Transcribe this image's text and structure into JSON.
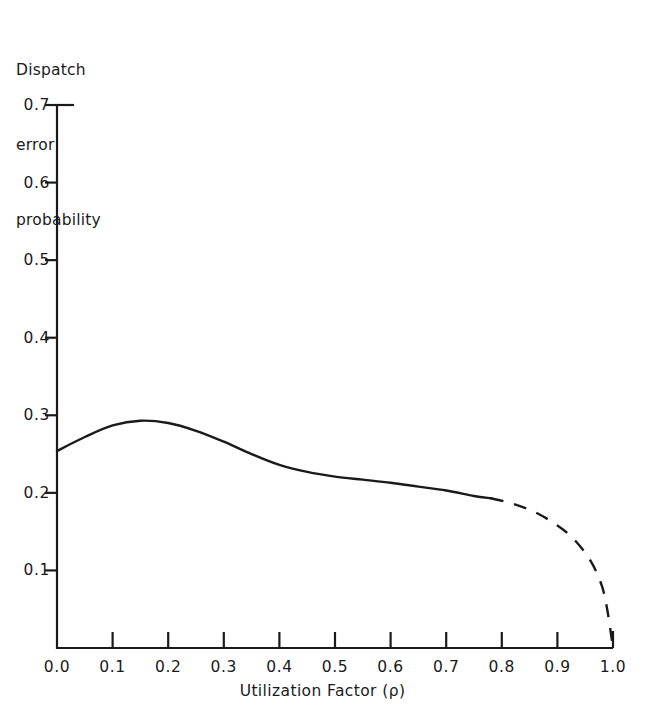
{
  "figure": {
    "background": "#ffffff",
    "ink_color": "#1a1a1a",
    "title_lines": [
      "Dispatch",
      "error",
      "probability"
    ]
  },
  "chart_data": {
    "type": "line",
    "title": "Dispatch error probability",
    "xlabel": "Utilization Factor (ρ)",
    "ylabel": "Dispatch error probability",
    "xlim": [
      0.0,
      1.0
    ],
    "ylim": [
      0.0,
      0.7
    ],
    "grid": false,
    "legend": null,
    "xticks": [
      "0.0",
      "0.1",
      "0.2",
      "0.3",
      "0.4",
      "0.5",
      "0.6",
      "0.7",
      "0.8",
      "0.9",
      "1.0"
    ],
    "xtick_values": [
      0.0,
      0.1,
      0.2,
      0.3,
      0.4,
      0.5,
      0.6,
      0.7,
      0.8,
      0.9,
      1.0
    ],
    "yticks": [
      "0.1",
      "0.2",
      "0.3",
      "0.4",
      "0.5",
      "0.6",
      "0.7"
    ],
    "ytick_values": [
      0.1,
      0.2,
      0.3,
      0.4,
      0.5,
      0.6,
      0.7
    ],
    "series": [
      {
        "name": "dispatch-error-probability-solid",
        "style": "solid",
        "x": [
          0.0,
          0.05,
          0.1,
          0.15,
          0.2,
          0.25,
          0.3,
          0.35,
          0.4,
          0.45,
          0.5,
          0.55,
          0.6,
          0.65,
          0.7,
          0.75,
          0.78
        ],
        "y": [
          0.254,
          0.272,
          0.287,
          0.293,
          0.29,
          0.28,
          0.266,
          0.25,
          0.236,
          0.227,
          0.221,
          0.217,
          0.213,
          0.208,
          0.203,
          0.196,
          0.193
        ]
      },
      {
        "name": "dispatch-error-probability-dashed",
        "style": "dashed",
        "x": [
          0.78,
          0.82,
          0.86,
          0.9,
          0.93,
          0.96,
          0.98,
          0.99,
          1.0
        ],
        "y": [
          0.193,
          0.186,
          0.175,
          0.158,
          0.14,
          0.112,
          0.08,
          0.048,
          0.0
        ]
      }
    ],
    "annotations": {
      "peak": {
        "x": 0.155,
        "y": 0.293
      },
      "start": {
        "x": 0.0,
        "y": 0.254
      },
      "solid_dash_transition": {
        "x": 0.78,
        "y": 0.193
      },
      "end": {
        "x": 1.0,
        "y": 0.0
      }
    }
  }
}
